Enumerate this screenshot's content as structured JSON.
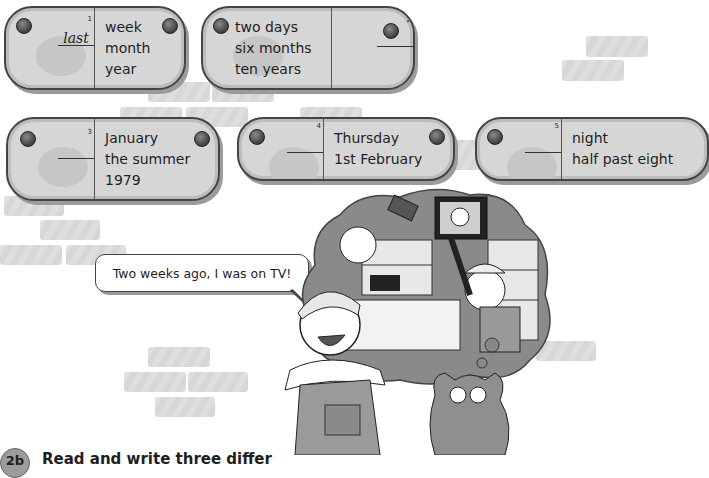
{
  "exercise": {
    "plaques": [
      {
        "id": 1,
        "number": "1",
        "answer": "last",
        "words": [
          "week",
          "month",
          "year"
        ],
        "blank_side": "left"
      },
      {
        "id": 2,
        "number": "2",
        "answer": "",
        "words": [
          "two days",
          "six months",
          "ten years"
        ],
        "blank_side": "right"
      },
      {
        "id": 3,
        "number": "3",
        "answer": "",
        "words": [
          "January",
          "the summer",
          "1979"
        ],
        "blank_side": "left"
      },
      {
        "id": 4,
        "number": "4",
        "answer": "",
        "words": [
          "Thursday",
          "1st February"
        ],
        "blank_side": "left"
      },
      {
        "id": 5,
        "number": "5",
        "answer": "",
        "words": [
          "night",
          "half past eight"
        ],
        "blank_side": "left"
      }
    ]
  },
  "speech_bubble": {
    "text": "Two weeks ago, I was on TV!"
  },
  "illustration": {
    "description": "Cartoon of a smiling man in overalls and cap with a thought bubble showing himself on TV in a shop, and a grey cat looking up"
  },
  "next_section": {
    "badge": "2b",
    "instruction": "Read and write three differ"
  },
  "colors": {
    "plaque_fill": "#d6d6d6",
    "plaque_border": "#444444",
    "brick": "#d6d6d6",
    "bolt": "#4a4a4a"
  }
}
